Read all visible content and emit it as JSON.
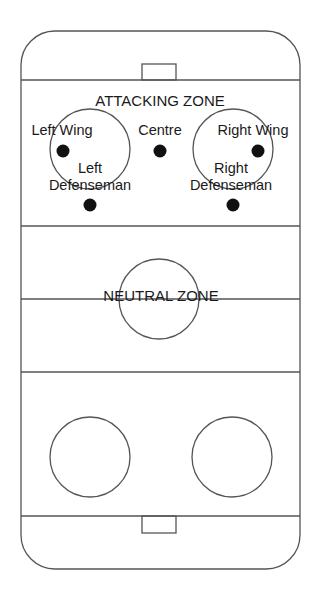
{
  "diagram": {
    "stroke_color": "#555555",
    "dot_color": "#111111",
    "zones": {
      "attacking": "ATTACKING ZONE",
      "neutral": "NEUTRAL ZONE"
    },
    "positions": [
      {
        "id": "left-wing",
        "label": "Left Wing",
        "x": 63,
        "y": 151
      },
      {
        "id": "centre",
        "label": "Centre",
        "x": 160,
        "y": 151
      },
      {
        "id": "right-wing",
        "label": "Right Wing",
        "x": 258,
        "y": 151
      },
      {
        "id": "left-defenseman",
        "label_line1": "Left",
        "label_line2": "Defenseman",
        "x": 90,
        "y": 205
      },
      {
        "id": "right-defenseman",
        "label_line1": "Right",
        "label_line2": "Defenseman",
        "x": 233,
        "y": 205
      }
    ]
  }
}
